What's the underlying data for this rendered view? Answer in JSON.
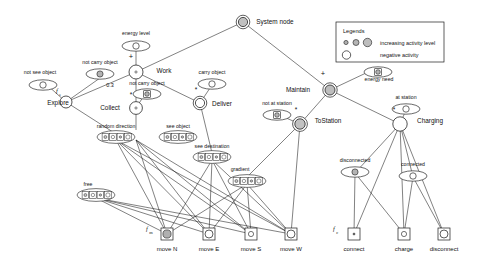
{
  "diagram": {
    "title": "System node",
    "legend": {
      "title": "Legends",
      "items": [
        {
          "label": "increasing activity level",
          "swatches": [
            "small-gray-circle",
            "medium-gray-circle",
            "large-gray-circle"
          ]
        },
        {
          "label": "negative activity",
          "swatches": [
            "large-white-circle"
          ]
        }
      ]
    },
    "root": {
      "name": "System node",
      "icon": "double-circle-gray-node"
    },
    "behaviour_nodes": [
      {
        "name": "Work",
        "icon": "circle-node-small-dot",
        "operator": "+"
      },
      {
        "name": "Explore",
        "icon": "circle-node-white",
        "gain": "f_e"
      },
      {
        "name": "Collect",
        "icon": "circle-node-small-dot",
        "operator": "*"
      },
      {
        "name": "Deliver",
        "icon": "double-circle-node-white",
        "operator": "*"
      },
      {
        "name": "Maintain",
        "icon": "double-circle-gray-node",
        "operator": "+"
      },
      {
        "name": "ToStation",
        "icon": "double-circle-gray-node",
        "operator": "*"
      },
      {
        "name": "Charging",
        "icon": "circle-node-white-large",
        "operator": "*"
      }
    ],
    "perception_nodes": [
      {
        "name": "energy level",
        "icon": "oval-white-circle"
      },
      {
        "name": "not see object",
        "icon": "oval-white-circle"
      },
      {
        "name": "not carry object",
        "icon": "oval-gray-circle"
      },
      {
        "name": "carry object",
        "icon": "oval-white-circle"
      },
      {
        "name": "not carry object",
        "icon": "oval-gray-square"
      },
      {
        "name": "energy need",
        "icon": "oval-gray-square"
      },
      {
        "name": "not at station",
        "icon": "oval-gray-square"
      },
      {
        "name": "at station",
        "icon": "oval-white-circle"
      },
      {
        "name": "disconnected",
        "icon": "oval-gray-circle"
      },
      {
        "name": "connected",
        "icon": "oval-white-circle"
      }
    ],
    "vector_perception_nodes": [
      {
        "name": "random direction",
        "cells": 4
      },
      {
        "name": "see object",
        "cells": 4
      },
      {
        "name": "see destination",
        "cells": 4
      },
      {
        "name": "free",
        "cells": 4
      },
      {
        "name": "gradient",
        "cells": 4
      }
    ],
    "action_nodes": [
      {
        "name": "move N",
        "icon": "square-gray-circle",
        "gain": "f_m"
      },
      {
        "name": "move E",
        "icon": "square-white-circle"
      },
      {
        "name": "move S",
        "icon": "square-small-circle"
      },
      {
        "name": "move W",
        "icon": "square-white-circle"
      },
      {
        "name": "connect",
        "icon": "square-small-dot",
        "gain": "f_c"
      },
      {
        "name": "charge",
        "icon": "square-small-circle"
      },
      {
        "name": "disconnect",
        "icon": "square-white-circle"
      }
    ],
    "edge_labels": [
      {
        "text": "+",
        "owner": "Work"
      },
      {
        "text": "0.3",
        "owner": "Work-Collect"
      },
      {
        "text": "*",
        "owner": "Collect"
      },
      {
        "text": "*",
        "owner": "Deliver"
      },
      {
        "text": "+",
        "owner": "Maintain"
      },
      {
        "text": "*",
        "owner": "ToStation"
      },
      {
        "text": "*",
        "owner": "Charging"
      }
    ],
    "gain_labels": [
      {
        "text": "f",
        "sub": "e"
      },
      {
        "text": "f",
        "sub": "m"
      },
      {
        "text": "f",
        "sub": "c"
      }
    ],
    "colors": {
      "stroke": "#1a1a1a",
      "background": "#ffffff",
      "node_fill_gray": "#a8a8a8",
      "node_fill_light": "#c9c9c9",
      "node_fill_white": "#ffffff"
    }
  }
}
